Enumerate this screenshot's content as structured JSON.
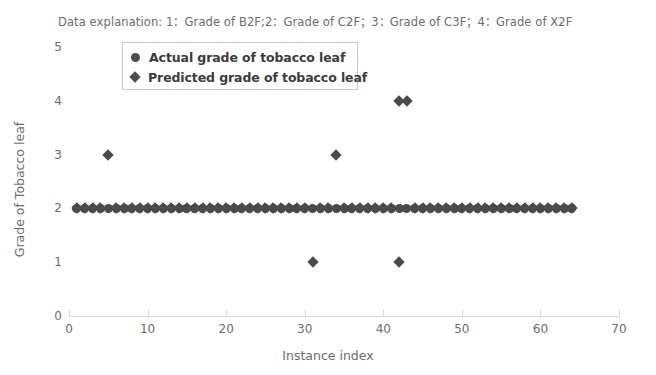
{
  "explanation": "Data explanation: 1：Grade of B2F;2：Grade of C2F；3：Grade of C3F；4：Grade of X2F",
  "legend": {
    "entries": [
      {
        "label": "Actual grade of tobacco leaf",
        "marker": "circle-icon",
        "color": "#4d4d4f"
      },
      {
        "label": "Predicted grade of tobacco leaf",
        "marker": "diamond-icon",
        "color": "#4d4d4f"
      }
    ]
  },
  "chart_data": {
    "type": "scatter",
    "title": "Data explanation: 1：Grade of B2F;2：Grade of C2F；3：Grade of C3F；4：Grade of X2F",
    "xlabel": "Instance index",
    "ylabel": "Grade of Tobacco leaf",
    "xlim": [
      0,
      70
    ],
    "ylim": [
      0,
      5
    ],
    "xticks": [
      0,
      10,
      20,
      30,
      40,
      50,
      60,
      70
    ],
    "yticks": [
      0,
      1,
      2,
      3,
      4,
      5
    ],
    "grid": false,
    "legend_position": "upper-left",
    "series": [
      {
        "name": "Actual grade of tobacco leaf",
        "marker": "circle",
        "color": "#4a4a4c",
        "x": [
          1,
          2,
          3,
          4,
          5,
          6,
          7,
          8,
          9,
          10,
          11,
          12,
          13,
          14,
          15,
          16,
          17,
          18,
          19,
          20,
          21,
          22,
          23,
          24,
          25,
          26,
          27,
          28,
          29,
          30,
          31,
          32,
          33,
          34,
          35,
          36,
          37,
          38,
          39,
          40,
          41,
          42,
          43,
          44,
          45,
          46,
          47,
          48,
          49,
          50,
          51,
          52,
          53,
          54,
          55,
          56,
          57,
          58,
          59,
          60,
          61,
          62,
          63,
          64
        ],
        "y": [
          2,
          2,
          2,
          2,
          2,
          2,
          2,
          2,
          2,
          2,
          2,
          2,
          2,
          2,
          2,
          2,
          2,
          2,
          2,
          2,
          2,
          2,
          2,
          2,
          2,
          2,
          2,
          2,
          2,
          2,
          2,
          2,
          2,
          2,
          2,
          2,
          2,
          2,
          2,
          2,
          2,
          2,
          2,
          2,
          2,
          2,
          2,
          2,
          2,
          2,
          2,
          2,
          2,
          2,
          2,
          2,
          2,
          2,
          2,
          2,
          2,
          2,
          2,
          2
        ]
      },
      {
        "name": "Predicted grade of tobacco leaf",
        "marker": "diamond",
        "color": "#4a4a4c",
        "x": [
          1,
          2,
          3,
          4,
          5,
          6,
          7,
          8,
          9,
          10,
          11,
          12,
          13,
          14,
          15,
          16,
          17,
          18,
          19,
          20,
          21,
          22,
          23,
          24,
          25,
          26,
          27,
          28,
          29,
          30,
          31,
          32,
          33,
          34,
          35,
          36,
          37,
          38,
          39,
          40,
          41,
          42,
          43,
          44,
          45,
          46,
          47,
          48,
          49,
          50,
          51,
          52,
          53,
          54,
          55,
          56,
          57,
          58,
          59,
          60,
          61,
          62,
          63,
          64
        ],
        "y": [
          2,
          2,
          2,
          2,
          3,
          2,
          2,
          2,
          2,
          2,
          2,
          2,
          2,
          2,
          2,
          2,
          2,
          2,
          2,
          2,
          2,
          2,
          2,
          2,
          2,
          2,
          2,
          2,
          2,
          2,
          1,
          2,
          2,
          3,
          2,
          2,
          2,
          2,
          2,
          2,
          2,
          1,
          4,
          2,
          2,
          2,
          2,
          2,
          2,
          2,
          2,
          2,
          2,
          2,
          2,
          2,
          2,
          2,
          2,
          2,
          2,
          2,
          2,
          2
        ]
      }
    ],
    "extra_points": [
      {
        "series": "Predicted grade of tobacco leaf",
        "x": 42,
        "y": 4
      }
    ]
  }
}
